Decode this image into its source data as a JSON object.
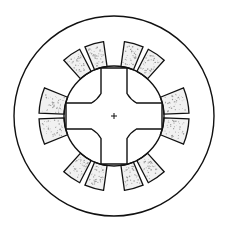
{
  "diagram": {
    "title": "",
    "type": "motor-cross-section",
    "center": [
      114,
      116
    ],
    "outer_radius": 100,
    "stator_inner_radius": 50,
    "coil_outer_radius": 75,
    "rotor": {
      "arm_half_width": 13,
      "arm_length": 48,
      "corner_radius": 26,
      "poles": 4
    },
    "coil_groups": [
      {
        "name": "right",
        "start_deg": -22,
        "end_deg": 22,
        "slot_deg": 0
      },
      {
        "name": "left",
        "start_deg": 158,
        "end_deg": 202,
        "slot_deg": 180
      },
      {
        "name": "top-left",
        "start_deg": -132,
        "end_deg": -98,
        "slot_deg": -115
      },
      {
        "name": "top-right",
        "start_deg": -82,
        "end_deg": -48,
        "slot_deg": -65
      },
      {
        "name": "bottom-left",
        "start_deg": 98,
        "end_deg": 132,
        "slot_deg": 115
      },
      {
        "name": "bottom-right",
        "start_deg": 48,
        "end_deg": 82,
        "slot_deg": 65
      }
    ],
    "colors": {
      "stroke": "#111111",
      "coil_fill": "#f1f1f1",
      "speckle": "#9a9a9a",
      "background": "#ffffff"
    }
  }
}
